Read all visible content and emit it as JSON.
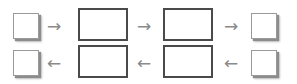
{
  "diagram": {
    "rows": [
      {
        "direction": "right",
        "nodes": [
          {
            "type": "small-box",
            "label": ""
          },
          {
            "type": "large-box",
            "label": ""
          },
          {
            "type": "large-box",
            "label": ""
          },
          {
            "type": "small-box",
            "label": ""
          }
        ],
        "arrows": [
          "→",
          "→",
          "→"
        ]
      },
      {
        "direction": "left",
        "nodes": [
          {
            "type": "small-box",
            "label": ""
          },
          {
            "type": "large-box",
            "label": ""
          },
          {
            "type": "large-box",
            "label": ""
          },
          {
            "type": "small-box",
            "label": ""
          }
        ],
        "arrows": [
          "←",
          "←",
          "←"
        ]
      }
    ],
    "colors": {
      "large_box_border": "#4a4a4a",
      "small_box_border": "#9a9a9a",
      "small_box_shadow": "#8c8c8c",
      "arrow": "#8a8a8a",
      "background": "#ffffff"
    }
  }
}
